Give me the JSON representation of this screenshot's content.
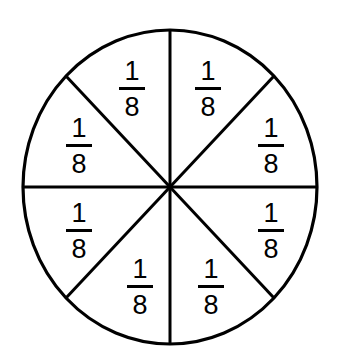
{
  "figure": {
    "shape_name": "circle",
    "stroke_color": "#000000",
    "fill_color": "#ffffff",
    "background_color": "#ffffff",
    "stroke_width": 3,
    "center": {
      "x": 170,
      "y": 187
    },
    "radius_x": 147,
    "radius_y": 157,
    "divider_count": 4,
    "sector_count": 8
  },
  "chart_data": {
    "type": "pie",
    "title": "",
    "xlabel": "",
    "ylabel": "",
    "legend_position": "none",
    "grid": false,
    "categories": [
      "top-right",
      "right-upper",
      "right-lower",
      "bottom-right",
      "bottom-left",
      "left-lower",
      "left-upper",
      "top-left"
    ],
    "values": [
      0.125,
      0.125,
      0.125,
      0.125,
      0.125,
      0.125,
      0.125,
      0.125
    ],
    "labels": [
      "1/8",
      "1/8",
      "1/8",
      "1/8",
      "1/8",
      "1/8",
      "1/8",
      "1/8"
    ],
    "numerator": "1",
    "denominator": "8"
  },
  "sectors": [
    {
      "name": "sector-top-left",
      "numerator": "1",
      "denominator": "8",
      "x": 132,
      "y": 88
    },
    {
      "name": "sector-top-right",
      "numerator": "1",
      "denominator": "8",
      "x": 208,
      "y": 88
    },
    {
      "name": "sector-left-upper",
      "numerator": "1",
      "denominator": "8",
      "x": 79,
      "y": 145
    },
    {
      "name": "sector-right-upper",
      "numerator": "1",
      "denominator": "8",
      "x": 271,
      "y": 145
    },
    {
      "name": "sector-left-lower",
      "numerator": "1",
      "denominator": "8",
      "x": 79,
      "y": 230
    },
    {
      "name": "sector-right-lower",
      "numerator": "1",
      "denominator": "8",
      "x": 271,
      "y": 230
    },
    {
      "name": "sector-bottom-left",
      "numerator": "1",
      "denominator": "8",
      "x": 140,
      "y": 286
    },
    {
      "name": "sector-bottom-right",
      "numerator": "1",
      "denominator": "8",
      "x": 211,
      "y": 286
    }
  ],
  "dividers": [
    {
      "name": "divider-vertical",
      "x1": 170,
      "y1": 30,
      "x2": 170,
      "y2": 344
    },
    {
      "name": "divider-horizontal",
      "x1": 23,
      "y1": 187,
      "x2": 317,
      "y2": 187
    },
    {
      "name": "divider-diagonal-nwse",
      "x1": 66,
      "y1": 76,
      "x2": 274,
      "y2": 298
    },
    {
      "name": "divider-diagonal-nesw",
      "x1": 274,
      "y1": 76,
      "x2": 66,
      "y2": 298
    }
  ]
}
